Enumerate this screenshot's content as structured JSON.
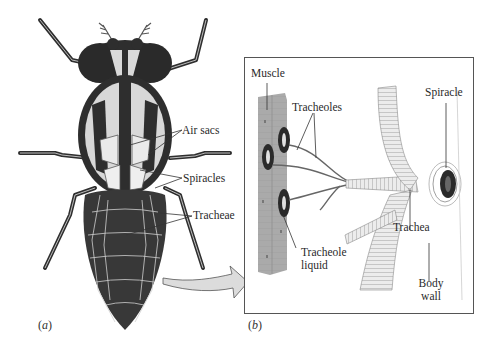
{
  "figure": {
    "panel_a": {
      "label_open": "(",
      "label_letter": "a",
      "label_close": ")",
      "subject": "insect (fly) body, dorsal view, tracheal system",
      "callouts": {
        "air_sacs": "Air sacs",
        "spiracles": "Spiracles",
        "tracheae": "Tracheae"
      }
    },
    "panel_b": {
      "label_open": "(",
      "label_letter": "b",
      "label_close": ")",
      "subject": "enlarged detail of trachea to muscle",
      "callouts": {
        "muscle": "Muscle",
        "tracheoles": "Tracheoles",
        "spiracle": "Spiracle",
        "trachea": "Trachea",
        "tracheole_liquid_line1": "Tracheole",
        "tracheole_liquid_line2": "liquid",
        "body_wall_line1": "Body",
        "body_wall_line2": "wall"
      }
    },
    "colors": {
      "insect_dark": "#2e2e2e",
      "insect_light": "#d9d9d9",
      "abdomen": "#3a3a3a",
      "muscle": "#a9a9a9",
      "trachea_fill": "#ececec",
      "trachea_stripe": "#9a9a9a",
      "arrow_fill": "#dcdcdc",
      "box_border": "#555555",
      "leader_line": "#333333"
    }
  }
}
